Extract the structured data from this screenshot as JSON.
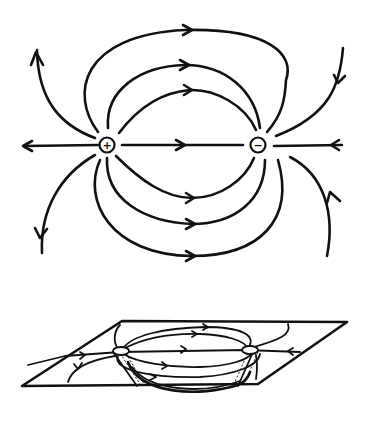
{
  "figure": {
    "stroke_color": "#111111",
    "background": "#ffffff"
  },
  "top_view": {
    "positive_charge": {
      "symbol": "+",
      "cx": 107,
      "cy": 145,
      "r": 7
    },
    "negative_charge": {
      "symbol": "−",
      "cx": 258,
      "cy": 145,
      "r": 7
    },
    "field_line_count": 14,
    "arrow_direction": "from positive to negative"
  },
  "perspective_view": {
    "description": "Field lines drawn in a plane shown in perspective, with charges on the plane",
    "plane_corners": [
      [
        122,
        321
      ],
      [
        347,
        322
      ],
      [
        258,
        385
      ],
      [
        22,
        386
      ]
    ]
  }
}
